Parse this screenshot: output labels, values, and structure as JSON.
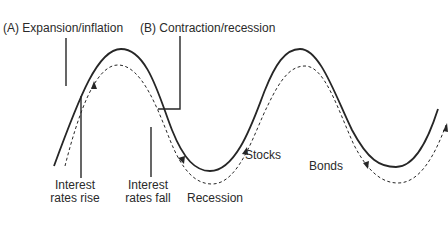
{
  "diagram": {
    "type": "economic-cycle",
    "colors": {
      "background": "#ffffff",
      "line": "#262626",
      "text": "#2a2a2a"
    },
    "phases": {
      "a_label": "(A) Expansion/inflation",
      "b_label": "(B) Contraction/recession"
    },
    "annotations": {
      "rates_rise_line1": "Interest",
      "rates_rise_line2": "rates rise",
      "rates_fall_line1": "Interest",
      "rates_fall_line2": "rates fall",
      "recession": "Recession"
    },
    "curves": [
      {
        "name": "Stocks",
        "style": "solid"
      },
      {
        "name": "Bonds",
        "style": "dashed-with-arrows"
      }
    ]
  }
}
